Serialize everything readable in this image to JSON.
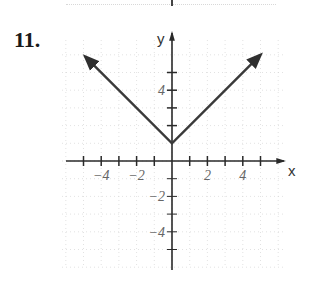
{
  "problem": {
    "number": "11."
  },
  "axes": {
    "x_label": "x",
    "y_label": "y",
    "x_tick_labels": [
      {
        "value": -4,
        "text": "−4"
      },
      {
        "value": -2,
        "text": "−2"
      },
      {
        "value": 2,
        "text": "2"
      },
      {
        "value": 4,
        "text": "4"
      }
    ],
    "y_tick_labels": [
      {
        "value": 4,
        "text": "4"
      },
      {
        "value": -2,
        "text": "−2"
      },
      {
        "value": -4,
        "text": "−4"
      }
    ]
  },
  "colors": {
    "line": "#3a3a3a",
    "axis": "#2a2a2a",
    "grid": "#cfcfcf",
    "label": "#666666"
  },
  "chart_data": {
    "type": "line",
    "title": "",
    "function": "y = |x| + 1",
    "xlabel": "x",
    "ylabel": "y",
    "xlim": [
      -6,
      6
    ],
    "ylim": [
      -6,
      7
    ],
    "grid": true,
    "legend": null,
    "x_ticks": [
      -5,
      -4,
      -3,
      -2,
      -1,
      1,
      2,
      3,
      4,
      5
    ],
    "y_ticks": [
      -5,
      -4,
      -3,
      -2,
      -1,
      2,
      3,
      4,
      5
    ],
    "x_tick_labels": [
      "-4",
      "-2",
      "2",
      "4"
    ],
    "y_tick_labels": [
      "4",
      "-2",
      "-4"
    ],
    "series": [
      {
        "name": "y = |x| + 1",
        "x": [
          -4.9,
          0,
          5.0
        ],
        "y": [
          5.9,
          1,
          6.0
        ],
        "arrows_at_ends": true
      }
    ],
    "vertex": {
      "x": 0,
      "y": 1
    }
  }
}
